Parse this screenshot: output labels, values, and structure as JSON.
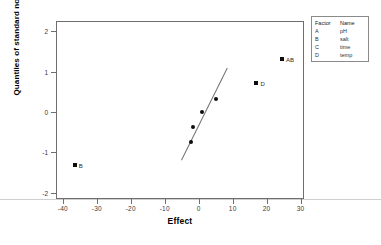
{
  "chart_data": {
    "type": "scatter",
    "title": "",
    "xlabel": "Effect",
    "ylabel": "Quantiles of standard normal",
    "xlim": [
      -42,
      31
    ],
    "ylim": [
      -2.15,
      2.25
    ],
    "xticks": [
      -40,
      -30,
      -20,
      -10,
      0,
      10,
      20,
      30
    ],
    "yticks": [
      2,
      1,
      0,
      -1,
      -2
    ],
    "grid": false,
    "legend_position": "outside-right-top",
    "points": [
      {
        "label": "B",
        "x": -36.5,
        "y": -1.3,
        "marker": "square",
        "label_side": "right"
      },
      {
        "label": "",
        "x": -2.3,
        "y": -0.75,
        "marker": "circle",
        "label_side": "right"
      },
      {
        "label": "",
        "x": -1.6,
        "y": -0.36,
        "marker": "circle",
        "label_side": "right"
      },
      {
        "label": "",
        "x": 0.9,
        "y": 0.0,
        "marker": "circle",
        "label_side": "right"
      },
      {
        "label": "",
        "x": 5.1,
        "y": 0.33,
        "marker": "circle",
        "label_side": "right"
      },
      {
        "label": "D",
        "x": 17.0,
        "y": 0.72,
        "marker": "square",
        "label_side": "right"
      },
      {
        "label": "AB",
        "x": 24.5,
        "y": 1.3,
        "marker": "square",
        "label_side": "right"
      }
    ],
    "fit_line": {
      "x1": -5.2,
      "y1": -1.18,
      "x2": 8.3,
      "y2": 1.1
    },
    "reference_line": {
      "y": -2.0,
      "style": "solid-faint",
      "full_width": true
    }
  },
  "legend": {
    "header": {
      "factor": "Factor",
      "name": "Name"
    },
    "rows": [
      {
        "factor": "A",
        "name": "pH"
      },
      {
        "factor": "B",
        "name": "salt"
      },
      {
        "factor": "C",
        "name": "time"
      },
      {
        "factor": "D",
        "name": "temp"
      }
    ]
  },
  "colors": {
    "marker": "#0d0d0d",
    "axis": "#6f6f6f",
    "fit_line": "#707070",
    "reference_line": "#cfcfcf",
    "legend_border": "#8a8a8a",
    "text": "#2a2a2a"
  }
}
